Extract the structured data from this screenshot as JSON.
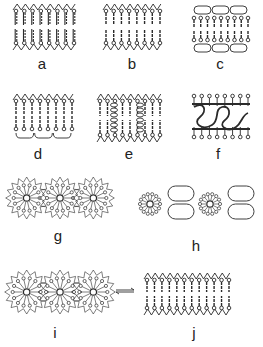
{
  "figure": {
    "ink_color": "#2a2a2a",
    "panels": [
      {
        "id": "a",
        "label": "a",
        "kind": "bilayer",
        "x": 16,
        "y": 3,
        "w": 58,
        "h": 48,
        "n": 8,
        "head": "zigzag",
        "tail_style": "double"
      },
      {
        "id": "b",
        "label": "b",
        "kind": "bilayer",
        "x": 106,
        "y": 3,
        "w": 54,
        "h": 48,
        "n": 8,
        "head": "zigzag-dense",
        "tail_style": "single"
      },
      {
        "id": "c",
        "label": "c",
        "kind": "bilayer-caps",
        "x": 194,
        "y": 6,
        "w": 54,
        "h": 46,
        "n": 9,
        "caps": 3
      },
      {
        "id": "d",
        "label": "d",
        "kind": "bilayer-bottom-caps",
        "x": 16,
        "y": 93,
        "w": 56,
        "h": 48,
        "n": 8,
        "caps": 3
      },
      {
        "id": "e",
        "label": "e",
        "kind": "bilayer-helix",
        "x": 100,
        "y": 93,
        "w": 60,
        "h": 50,
        "n": 9,
        "helices": 2
      },
      {
        "id": "f",
        "label": "f",
        "kind": "bilayer-loops",
        "x": 194,
        "y": 93,
        "w": 54,
        "h": 48,
        "n": 8
      },
      {
        "id": "g",
        "label": "g",
        "kind": "micelles",
        "x": 10,
        "y": 178,
        "w": 100,
        "h": 40,
        "count": 3,
        "r": 17
      },
      {
        "id": "h",
        "label": "h",
        "kind": "micelles-caps",
        "x": 136,
        "y": 186,
        "w": 120,
        "h": 36,
        "count": 2,
        "r": 14
      },
      {
        "id": "i",
        "label": "i",
        "kind": "micelles",
        "x": 10,
        "y": 270,
        "w": 100,
        "h": 44,
        "count": 3,
        "r": 18
      },
      {
        "id": "j",
        "label": "j",
        "kind": "bilayer",
        "x": 147,
        "y": 272,
        "w": 82,
        "h": 44,
        "n": 12,
        "head": "zigzag",
        "tail_style": "single"
      }
    ],
    "labels": [
      {
        "text": "a",
        "x": 42,
        "y": 56
      },
      {
        "text": "b",
        "x": 132,
        "y": 56
      },
      {
        "text": "c",
        "x": 220,
        "y": 56
      },
      {
        "text": "d",
        "x": 38,
        "y": 146
      },
      {
        "text": "e",
        "x": 129,
        "y": 146
      },
      {
        "text": "f",
        "x": 218,
        "y": 146
      },
      {
        "text": "g",
        "x": 58,
        "y": 228
      },
      {
        "text": "h",
        "x": 196,
        "y": 238
      },
      {
        "text": "i",
        "x": 55,
        "y": 325
      },
      {
        "text": "j",
        "x": 194,
        "y": 325
      }
    ],
    "arrow": {
      "symbol": "equilibrium-arrow",
      "x1": 116,
      "x2": 134,
      "y": 291
    }
  }
}
